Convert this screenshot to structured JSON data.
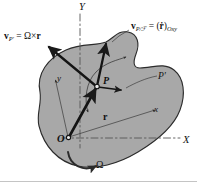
{
  "figure": {
    "domain": "Diagram",
    "width_px": 197,
    "height_px": 187
  },
  "colors": {
    "body_fill": "#a8a8a8",
    "body_stroke": "#2b2b2b",
    "vector_stroke": "#1a1a1a",
    "thin_line": "#3a3a3a",
    "dashed_axis": "#555555",
    "text": "#111111",
    "page_background": "#ffffff",
    "bottom_rule": "#b5b5b5"
  },
  "labels": {
    "velocity_p_prime": {
      "name": "v_P' = Ω × r",
      "vector_symbol": "v",
      "vector_subscript": "P'",
      "equals": "=",
      "omega": "Ω",
      "cross": "×",
      "r_symbol": "r"
    },
    "velocity_p_rel_frame": {
      "name": "v_P/ℱ = (ṙ)_Oxy",
      "vector_symbol": "v",
      "vector_subscript": "P/ℱ",
      "equals": "=",
      "rdot_open": "(",
      "rdot": "ṙ",
      "rdot_close": ")",
      "rdot_subscript": "Oxy"
    },
    "point_P": "P",
    "point_P_prime": "P′",
    "origin_O": "O",
    "axis_X": "X",
    "axis_Y": "Y",
    "axis_x_small": "x",
    "axis_y_small": "y",
    "position_vector_r": "r",
    "angular_velocity": "Ω"
  },
  "geometry": {
    "origin_point": {
      "x": 68,
      "y": 138
    },
    "point_P": {
      "x": 97,
      "y": 86
    },
    "point_P_prime_label_anchor": {
      "x": 158,
      "y": 76
    },
    "fixed_frame": {
      "Y_axis": {
        "x1": 80,
        "y1": 14,
        "x2": 80,
        "y2": 146,
        "style": "dash-dot"
      },
      "X_axis": {
        "x1": 62,
        "y1": 138,
        "x2": 182,
        "y2": 138,
        "style": "dash-dot"
      }
    },
    "rotating_frame": {
      "y_axis": {
        "x1": 68,
        "y1": 138,
        "x2": 55,
        "y2": 78,
        "style": "thin-solid"
      },
      "x_axis": {
        "x1": 68,
        "y1": 138,
        "x2": 156,
        "y2": 110,
        "style": "thin-solid"
      }
    },
    "vectors": [
      {
        "id": "r",
        "label": "r",
        "from": {
          "x": 68,
          "y": 138
        },
        "to": {
          "x": 96,
          "y": 88
        },
        "weight": "bold",
        "arrowhead": "solid-filled"
      },
      {
        "id": "v_P_prime",
        "label": "v_P' = Ω × r",
        "from": {
          "x": 97,
          "y": 86
        },
        "to": {
          "x": 47,
          "y": 46
        },
        "weight": "bold",
        "arrowhead": "solid-filled"
      },
      {
        "id": "v_P_rel_frame",
        "label": "v_P/ℱ = (ṙ)_Oxy",
        "from": {
          "x": 97,
          "y": 86
        },
        "to": {
          "x": 107,
          "y": 42
        },
        "weight": "bold",
        "arrowhead": "solid-filled"
      },
      {
        "id": "tangent_short",
        "label": "",
        "from": {
          "x": 97,
          "y": 86
        },
        "to": {
          "x": 122,
          "y": 90
        },
        "weight": "medium",
        "arrowhead": "solid-filled"
      }
    ],
    "curved_arrow_path": {
      "id": "path-through-P",
      "description": "thin curved path of P through the body, arrowheads at both ends"
    },
    "omega_arc": {
      "id": "omega-rotation-arc",
      "description": "counterclockwise arc below origin indicating body angular velocity",
      "center": {
        "x": 88,
        "y": 148
      },
      "radius": 22,
      "direction": "counterclockwise"
    },
    "body_outline_description": "irregular closed blob (rigid body) filled mid-gray with dark outline, spanning most of the frame"
  }
}
